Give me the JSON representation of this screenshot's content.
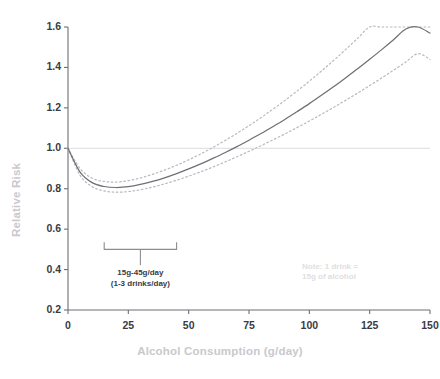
{
  "chart_data": {
    "type": "line",
    "title": "",
    "subtitle": "",
    "xlabel": "Alcohol Consumption (g/day)",
    "ylabel": "Relative Risk",
    "xlim": [
      0,
      150
    ],
    "ylim": [
      0.2,
      1.6
    ],
    "xticks": [
      0,
      25,
      50,
      75,
      100,
      125,
      150
    ],
    "yticks": [
      0.2,
      0.4,
      0.6,
      0.8,
      1.0,
      1.2,
      1.4,
      1.6
    ],
    "xtick_labels": [
      "0",
      "25",
      "50",
      "75",
      "100",
      "125",
      "150"
    ],
    "ytick_labels": [
      "0.2",
      "0.4",
      "0.6",
      "0.8",
      "1.0",
      "1.2",
      "1.4",
      "1.6"
    ],
    "grid": false,
    "legend_position": "none",
    "reference_lines": [
      {
        "name": "null-risk-line",
        "axis": "y",
        "value": 1.0,
        "color": "#dcdcdf",
        "style": "solid"
      }
    ],
    "x": [
      0,
      5,
      10,
      15,
      20,
      25,
      30,
      35,
      40,
      45,
      50,
      55,
      60,
      65,
      70,
      75,
      80,
      85,
      90,
      95,
      100,
      105,
      110,
      115,
      120,
      125,
      130,
      135,
      140,
      145,
      150
    ],
    "series": [
      {
        "name": "Relative risk (point estimate)",
        "style": "solid",
        "color": "#6f6f76",
        "values": [
          1.0,
          0.882,
          0.83,
          0.811,
          0.806,
          0.81,
          0.821,
          0.836,
          0.854,
          0.875,
          0.898,
          0.923,
          0.95,
          0.978,
          1.008,
          1.04,
          1.073,
          1.108,
          1.144,
          1.182,
          1.221,
          1.262,
          1.304,
          1.348,
          1.393,
          1.44,
          1.488,
          1.538,
          1.59,
          1.643,
          1.57
        ]
      },
      {
        "name": "Upper 95% confidence limit",
        "style": "dotted",
        "color": "#b9b9be",
        "values": [
          1.0,
          0.9,
          0.852,
          0.836,
          0.833,
          0.84,
          0.853,
          0.871,
          0.892,
          0.916,
          0.943,
          0.972,
          1.004,
          1.038,
          1.074,
          1.112,
          1.152,
          1.194,
          1.238,
          1.284,
          1.332,
          1.382,
          1.434,
          1.488,
          1.544,
          1.602,
          1.662,
          1.724,
          1.788,
          1.854,
          1.63
        ]
      },
      {
        "name": "Lower 95% confidence limit",
        "style": "dotted",
        "color": "#b9b9be",
        "values": [
          1.0,
          0.866,
          0.81,
          0.789,
          0.783,
          0.786,
          0.795,
          0.808,
          0.824,
          0.842,
          0.862,
          0.884,
          0.907,
          0.932,
          0.958,
          0.985,
          1.013,
          1.042,
          1.072,
          1.103,
          1.135,
          1.168,
          1.202,
          1.237,
          1.273,
          1.31,
          1.348,
          1.387,
          1.427,
          1.468,
          1.44
        ]
      }
    ],
    "annotations": [
      {
        "name": "moderate-intake-bracket",
        "type": "bracket",
        "x_start": 15,
        "x_end": 45,
        "y": 0.5,
        "label_line1": "15g-45g/day",
        "label_line2": "(1-3 drinks/day)",
        "color": "#8d8d93"
      },
      {
        "name": "drink-equivalence-note",
        "type": "text",
        "x": 97,
        "y": 0.4,
        "line1": "Note: 1 drink =",
        "line2": "15g of alcohol",
        "color": "#e0e0e2"
      }
    ]
  },
  "style": {
    "axis_color": "#6f6f76",
    "tick_text_color": "#3b3b3f",
    "axis_label_color": "#c9c9cc",
    "curve_color": "#6f6f76",
    "ci_color": "#b9b9be",
    "reference_line_color": "#dcdcdf",
    "background": "#ffffff"
  }
}
